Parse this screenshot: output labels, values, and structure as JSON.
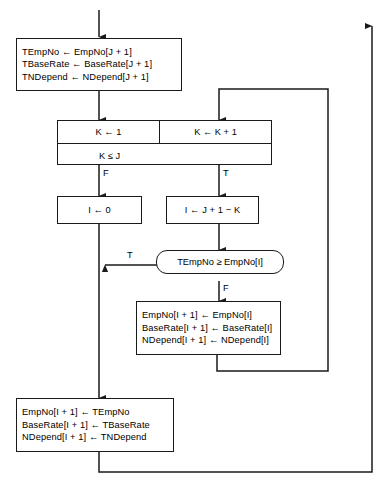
{
  "diagram": {
    "colors": {
      "stroke": "#1a1a1a",
      "background": "#ffffff",
      "text": "#000000"
    },
    "nodes": {
      "save_temp": {
        "kind": "process",
        "lines": [
          "TEmpNo ← EmpNo[J + 1]",
          "TBaseRate ← BaseRate[J + 1]",
          "TNDepend ← NDepend[J + 1]"
        ]
      },
      "k_loop": {
        "kind": "loop",
        "init": "K ← 1",
        "increment": "K ← K + 1",
        "condition": "K ≤ J"
      },
      "i_zero": {
        "kind": "process",
        "lines": [
          "I ← 0"
        ]
      },
      "i_calc": {
        "kind": "process",
        "lines": [
          "I ← J + 1 − K"
        ]
      },
      "compare": {
        "kind": "decision",
        "text": "TEmpNo ≥ EmpNo[I]"
      },
      "shift": {
        "kind": "process",
        "lines": [
          "EmpNo[I + 1] ← EmpNo[I]",
          "BaseRate[I + 1] ← BaseRate[I]",
          "NDepend[I + 1] ← NDepend[I]"
        ]
      },
      "insert": {
        "kind": "process",
        "lines": [
          "EmpNo[I + 1] ← TEmpNo",
          "BaseRate[I + 1] ← TBaseRate",
          "NDepend[I + 1] ← TNDepend"
        ]
      }
    },
    "edge_labels": {
      "loop_false": "F",
      "loop_true": "T",
      "compare_true": "T",
      "compare_false": "F"
    }
  }
}
